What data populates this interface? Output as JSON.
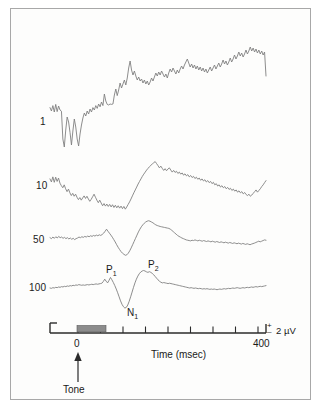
{
  "figure": {
    "kind": "erp-averaging-figure",
    "background_color": "#fdfdfc",
    "frame_border_color": "#a8a8a8",
    "trace_color": "#808080",
    "axis_color": "#2b2b2b",
    "tone_bar_color": "#8c8c8c"
  },
  "trace_labels": [
    {
      "id": "n1",
      "text": "1"
    },
    {
      "id": "n10",
      "text": "10"
    },
    {
      "id": "n50",
      "text": "50"
    },
    {
      "id": "n100",
      "text": "100"
    }
  ],
  "peak_labels": {
    "p1": "P",
    "p1_sub": "1",
    "n1": "N",
    "n1_sub": "1",
    "p2": "P",
    "p2_sub": "2"
  },
  "axis": {
    "time_label": "Time (msec)",
    "tick_zero_label": "0",
    "tick_end_label": "400",
    "tick_values": [
      0,
      50,
      100,
      150,
      200,
      250,
      300,
      350,
      400
    ],
    "event_marker_label": "Tone"
  },
  "scale_bar": {
    "plus_sign": "+",
    "minus_sign": "–",
    "amplitude_label": "2 µV"
  },
  "chart_data": {
    "type": "line",
    "title": "",
    "xlabel": "Time (msec)",
    "ylabel": "",
    "xlim": [
      -50,
      400
    ],
    "grid": false,
    "legend": "left-of-trace",
    "annotations": [
      {
        "text": "P1",
        "series": "100",
        "x": 95,
        "kind": "positive-peak"
      },
      {
        "text": "N1",
        "series": "100",
        "x": 125,
        "kind": "negative-peak"
      },
      {
        "text": "P2",
        "series": "100",
        "x": 185,
        "kind": "positive-peak"
      },
      {
        "text": "Tone",
        "x": 0,
        "kind": "stimulus-onset-arrow"
      }
    ],
    "stimulus_bar": {
      "start": 10,
      "end": 60,
      "label": "tone duration"
    },
    "scale_bar_uv": 2,
    "series": [
      {
        "name": "1",
        "trials": 1,
        "values": [
          0.62,
          0.45,
          0.72,
          0.4,
          0.78,
          0.42,
          0.7,
          0.5,
          0.44,
          -0.95,
          -1.35,
          -0.5,
          0.15,
          -0.1,
          -0.62,
          -1.25,
          -0.55,
          0.05,
          -0.35,
          -0.95,
          -1.3,
          -0.7,
          -0.25,
          0.1,
          0.35,
          0.2,
          0.45,
          0.3,
          0.55,
          0.4,
          0.62,
          0.5,
          0.72,
          0.58,
          0.8,
          0.66,
          0.9,
          0.72,
          1.3,
          0.95,
          0.78,
          0.75,
          0.8,
          0.78,
          0.8,
          1.25,
          1.55,
          1.22,
          1.5,
          1.85,
          1.6,
          1.8,
          2.0,
          1.75,
          2.1,
          2.6,
          2.95,
          2.5,
          2.25,
          2.45,
          2.2,
          2.0,
          2.15,
          1.95,
          2.05,
          1.85,
          2.0,
          1.8,
          1.95,
          1.75,
          1.9,
          2.1,
          1.95,
          2.15,
          2.35,
          2.2,
          2.4,
          2.25,
          2.45,
          2.3,
          2.15,
          2.3,
          2.1,
          2.35,
          2.55,
          2.4,
          2.6,
          2.45,
          2.3,
          2.5,
          2.35,
          2.55,
          2.7,
          2.55,
          2.75,
          2.9,
          3.05,
          2.85,
          2.65,
          2.8,
          2.6,
          2.75,
          2.55,
          2.7,
          2.5,
          2.65,
          2.45,
          2.6,
          2.4,
          2.55,
          2.35,
          2.5,
          2.65,
          2.45,
          2.6,
          2.75,
          2.55,
          2.7,
          2.85,
          2.65,
          2.8,
          3.0,
          2.8,
          2.95,
          2.75,
          2.9,
          3.1,
          2.9,
          3.05,
          3.25,
          3.05,
          3.2,
          3.4,
          3.2,
          3.35,
          3.15,
          3.3,
          3.5,
          3.3,
          3.45,
          3.65,
          3.45,
          3.6,
          3.4,
          3.55,
          3.35,
          3.5,
          3.3,
          3.45,
          3.25,
          3.4,
          2.2
        ]
      },
      {
        "name": "10",
        "trials": 10,
        "values": [
          0.3,
          0.12,
          0.42,
          0.1,
          0.4,
          0.15,
          0.35,
          0.05,
          -0.1,
          -0.22,
          -0.05,
          -0.28,
          -0.45,
          -0.3,
          -0.52,
          -0.68,
          -0.55,
          -0.72,
          -0.6,
          -0.78,
          -0.92,
          -0.8,
          -0.95,
          -0.82,
          -0.7,
          -0.85,
          -0.72,
          -0.88,
          -1.02,
          -0.9,
          -0.75,
          -0.6,
          -0.78,
          -0.95,
          -1.1,
          -0.95,
          -1.12,
          -1.28,
          -1.15,
          -1.3,
          -1.18,
          -1.32,
          -1.2,
          -1.35,
          -1.22,
          -1.38,
          -1.25,
          -1.4,
          -1.28,
          -1.42,
          -1.3,
          -1.45,
          -1.32,
          -1.48,
          -1.35,
          -1.2,
          -1.05,
          -0.88,
          -0.7,
          -0.52,
          -0.35,
          -0.18,
          0.0,
          0.15,
          0.3,
          0.45,
          0.58,
          0.7,
          0.82,
          0.92,
          1.02,
          1.1,
          1.18,
          1.25,
          1.32,
          1.2,
          1.08,
          0.95,
          1.05,
          0.92,
          0.8,
          0.9,
          0.78,
          0.88,
          0.95,
          0.82,
          0.7,
          0.8,
          0.68,
          0.75,
          0.62,
          0.7,
          0.58,
          0.65,
          0.52,
          0.6,
          0.48,
          0.55,
          0.42,
          0.5,
          0.38,
          0.45,
          0.32,
          0.4,
          0.28,
          0.35,
          0.22,
          0.3,
          0.18,
          0.25,
          0.12,
          0.2,
          0.08,
          0.15,
          0.02,
          0.1,
          -0.05,
          0.02,
          -0.12,
          -0.05,
          -0.18,
          -0.1,
          -0.22,
          -0.15,
          -0.28,
          -0.2,
          -0.32,
          -0.25,
          -0.38,
          -0.3,
          -0.42,
          -0.35,
          -0.48,
          -0.4,
          -0.52,
          -0.45,
          -0.58,
          -0.5,
          -0.62,
          -0.68,
          -0.6,
          -0.72,
          -0.65,
          -0.55,
          -0.45,
          -0.35,
          -0.48,
          -0.38,
          -0.28,
          -0.15,
          -0.05,
          0.08,
          0.2
        ]
      },
      {
        "name": "50",
        "trials": 50,
        "values": [
          0.02,
          -0.04,
          0.06,
          -0.02,
          0.08,
          0.0,
          0.1,
          0.02,
          0.06,
          -0.02,
          0.04,
          -0.04,
          0.02,
          -0.06,
          0.0,
          -0.08,
          -0.02,
          -0.1,
          -0.04,
          0.0,
          0.06,
          0.02,
          0.08,
          0.04,
          0.1,
          0.06,
          0.12,
          0.08,
          0.14,
          0.1,
          0.16,
          0.12,
          0.18,
          0.14,
          0.2,
          0.16,
          0.22,
          0.3,
          0.42,
          0.55,
          0.42,
          0.3,
          0.18,
          0.05,
          -0.1,
          -0.25,
          -0.42,
          -0.58,
          -0.72,
          -0.85,
          -0.95,
          -1.02,
          -1.08,
          -1.05,
          -0.95,
          -0.8,
          -0.62,
          -0.42,
          -0.22,
          -0.02,
          0.18,
          0.38,
          0.55,
          0.7,
          0.82,
          0.92,
          1.0,
          1.05,
          1.08,
          1.05,
          1.0,
          0.95,
          0.88,
          0.82,
          0.78,
          0.75,
          0.72,
          0.7,
          0.68,
          0.66,
          0.64,
          0.62,
          0.6,
          0.55,
          0.48,
          0.4,
          0.32,
          0.24,
          0.16,
          0.1,
          0.05,
          0.0,
          -0.04,
          -0.08,
          -0.12,
          -0.14,
          -0.16,
          -0.18,
          -0.14,
          -0.16,
          -0.12,
          -0.15,
          -0.18,
          -0.14,
          -0.17,
          -0.2,
          -0.16,
          -0.19,
          -0.22,
          -0.18,
          -0.21,
          -0.24,
          -0.2,
          -0.23,
          -0.26,
          -0.22,
          -0.25,
          -0.28,
          -0.24,
          -0.27,
          -0.3,
          -0.26,
          -0.29,
          -0.32,
          -0.28,
          -0.31,
          -0.34,
          -0.3,
          -0.33,
          -0.36,
          -0.32,
          -0.35,
          -0.38,
          -0.34,
          -0.37,
          -0.4,
          -0.36,
          -0.39,
          -0.42,
          -0.38,
          -0.35,
          -0.32,
          -0.28,
          -0.24,
          -0.2,
          -0.24,
          -0.2,
          -0.16,
          -0.12,
          -0.14
        ]
      },
      {
        "name": "100",
        "trials": 100,
        "values": [
          0.0,
          -0.02,
          0.02,
          0.0,
          0.04,
          0.02,
          0.06,
          0.04,
          0.08,
          0.06,
          0.1,
          0.08,
          0.12,
          0.1,
          0.14,
          0.12,
          0.16,
          0.14,
          0.18,
          0.16,
          0.2,
          0.18,
          0.16,
          0.18,
          0.16,
          0.18,
          0.2,
          0.18,
          0.2,
          0.22,
          0.2,
          0.22,
          0.24,
          0.22,
          0.24,
          0.26,
          0.28,
          0.38,
          0.52,
          0.4,
          0.3,
          0.45,
          0.62,
          0.48,
          0.32,
          0.14,
          -0.06,
          -0.28,
          -0.52,
          -0.76,
          -0.96,
          -1.1,
          -1.18,
          -1.14,
          -1.0,
          -0.78,
          -0.52,
          -0.24,
          0.04,
          0.3,
          0.52,
          0.7,
          0.84,
          0.94,
          1.0,
          1.03,
          1.0,
          0.95,
          0.92,
          0.96,
          0.92,
          0.86,
          0.78,
          0.68,
          0.58,
          0.48,
          0.4,
          0.34,
          0.3,
          0.32,
          0.3,
          0.28,
          0.26,
          0.28,
          0.26,
          0.24,
          0.22,
          0.2,
          0.18,
          0.16,
          0.14,
          0.12,
          0.1,
          0.08,
          0.06,
          0.04,
          0.02,
          0.0,
          0.02,
          0.0,
          -0.02,
          0.0,
          -0.02,
          -0.04,
          -0.02,
          -0.04,
          -0.06,
          -0.04,
          -0.06,
          -0.04,
          -0.06,
          -0.08,
          -0.06,
          -0.08,
          -0.06,
          -0.08,
          -0.1,
          -0.08,
          -0.06,
          -0.08,
          -0.06,
          -0.04,
          -0.06,
          -0.04,
          -0.02,
          -0.04,
          -0.02,
          0.0,
          -0.02,
          0.0,
          0.02,
          0.0,
          -0.02,
          0.0,
          0.02,
          0.0,
          0.02,
          0.04,
          0.02,
          0.04,
          0.06,
          0.04,
          0.06,
          0.08,
          0.06,
          0.08,
          0.1,
          0.08,
          0.1,
          0.12,
          0.14
        ]
      }
    ]
  }
}
